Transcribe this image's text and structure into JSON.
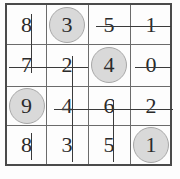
{
  "puzzle": {
    "type": "number-search-grid",
    "rows": 4,
    "cols": 4,
    "grid": [
      [
        {
          "value": "8",
          "circled": false
        },
        {
          "value": "3",
          "circled": true
        },
        {
          "value": "5",
          "circled": false
        },
        {
          "value": "1",
          "circled": false
        }
      ],
      [
        {
          "value": "7",
          "circled": false
        },
        {
          "value": "2",
          "circled": false
        },
        {
          "value": "4",
          "circled": true
        },
        {
          "value": "0",
          "circled": false
        }
      ],
      [
        {
          "value": "9",
          "circled": true
        },
        {
          "value": "4",
          "circled": false
        },
        {
          "value": "6",
          "circled": false
        },
        {
          "value": "2",
          "circled": false
        }
      ],
      [
        {
          "value": "8",
          "circled": false
        },
        {
          "value": "3",
          "circled": false
        },
        {
          "value": "5",
          "circled": false
        },
        {
          "value": "1",
          "circled": true
        }
      ]
    ],
    "circled_values": [
      "3",
      "4",
      "9",
      "1"
    ],
    "strikes": [
      {
        "id": "strike-v-col1-rows1-2",
        "orientation": "vertical",
        "x": 31,
        "y1": 14,
        "y2": 73
      },
      {
        "id": "strike-v-col2-rows2-4",
        "orientation": "vertical",
        "x": 72,
        "y1": 56,
        "y2": 162
      },
      {
        "id": "strike-v-col3-rows3-4",
        "orientation": "vertical",
        "x": 113,
        "y1": 100,
        "y2": 162
      },
      {
        "id": "strike-v-col1-row4",
        "orientation": "vertical",
        "x": 31,
        "y1": 133,
        "y2": 160
      },
      {
        "id": "strike-h-row1-cols3-4",
        "orientation": "horizontal",
        "y": 26,
        "x1": 96,
        "x2": 171
      },
      {
        "id": "strike-h-row2-cols1-2",
        "orientation": "horizontal",
        "y": 67,
        "x1": 9,
        "x2": 88
      },
      {
        "id": "strike-h-row2-col4",
        "orientation": "horizontal",
        "y": 67,
        "x1": 135,
        "x2": 171
      },
      {
        "id": "strike-h-row3-cols2-4",
        "orientation": "horizontal",
        "y": 109,
        "x1": 54,
        "x2": 173
      }
    ]
  },
  "colors": {
    "frame_border": "#4a4a4a",
    "grid_line": "#6b6b6b",
    "digit": "#2b2b2b",
    "circle_fill": "#d9d9d9",
    "circle_border": "#a8a8a8",
    "strike": "#3a3a3a",
    "background": "#fdfdfd"
  },
  "geometry": {
    "frame": {
      "left": 5,
      "top": 3,
      "width": 167,
      "height": 163
    },
    "v_lines": [
      41.5,
      83.5,
      125.5
    ],
    "h_lines": [
      41.5,
      83.5,
      122.5
    ],
    "cells": [
      [
        {
          "l": 0,
          "t": 0,
          "w": 41,
          "h": 41
        },
        {
          "l": 41,
          "t": 0,
          "w": 42,
          "h": 41
        },
        {
          "l": 83,
          "t": 0,
          "w": 42,
          "h": 41
        },
        {
          "l": 125,
          "t": 0,
          "w": 42,
          "h": 41
        }
      ],
      [
        {
          "l": 0,
          "t": 41,
          "w": 41,
          "h": 42
        },
        {
          "l": 41,
          "t": 41,
          "w": 42,
          "h": 42
        },
        {
          "l": 83,
          "t": 41,
          "w": 42,
          "h": 42
        },
        {
          "l": 125,
          "t": 41,
          "w": 42,
          "h": 42
        }
      ],
      [
        {
          "l": 0,
          "t": 83,
          "w": 41,
          "h": 39
        },
        {
          "l": 41,
          "t": 83,
          "w": 42,
          "h": 39
        },
        {
          "l": 83,
          "t": 83,
          "w": 42,
          "h": 39
        },
        {
          "l": 125,
          "t": 83,
          "w": 42,
          "h": 39
        }
      ],
      [
        {
          "l": 0,
          "t": 122,
          "w": 41,
          "h": 41
        },
        {
          "l": 41,
          "t": 122,
          "w": 42,
          "h": 41
        },
        {
          "l": 83,
          "t": 122,
          "w": 42,
          "h": 41
        },
        {
          "l": 125,
          "t": 122,
          "w": 42,
          "h": 41
        }
      ]
    ]
  }
}
